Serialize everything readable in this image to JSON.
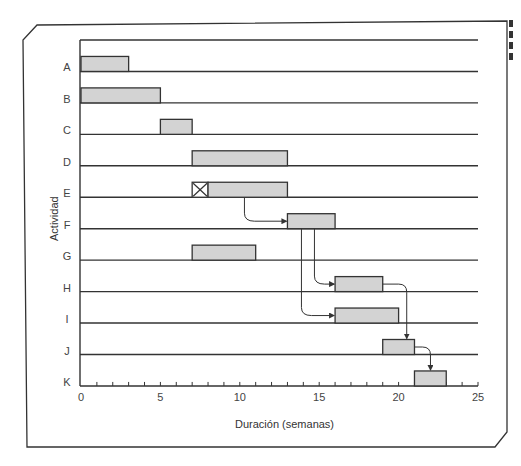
{
  "chart_data": {
    "type": "gantt",
    "title": "",
    "xlabel": "Duración (semanas)",
    "ylabel": "Actividad",
    "xlim": [
      0,
      25
    ],
    "xticks_major": [
      0,
      5,
      10,
      15,
      20,
      25
    ],
    "xticks_minor_step": 1,
    "grid": false,
    "bar_color": "#d3d3d3",
    "line_color": "#333333",
    "categories": [
      "A",
      "B",
      "C",
      "D",
      "E",
      "F",
      "G",
      "H",
      "I",
      "J",
      "K"
    ],
    "tasks": [
      {
        "name": "A",
        "start": 0,
        "end": 3
      },
      {
        "name": "B",
        "start": 0,
        "end": 5
      },
      {
        "name": "C",
        "start": 5,
        "end": 7
      },
      {
        "name": "D",
        "start": 7,
        "end": 13
      },
      {
        "name": "E",
        "start": 7,
        "end": 13,
        "crossed_segment": [
          7,
          8
        ]
      },
      {
        "name": "F",
        "start": 13,
        "end": 16
      },
      {
        "name": "G",
        "start": 7,
        "end": 11
      },
      {
        "name": "H",
        "start": 16,
        "end": 19
      },
      {
        "name": "I",
        "start": 16,
        "end": 20
      },
      {
        "name": "J",
        "start": 19,
        "end": 21
      },
      {
        "name": "K",
        "start": 21,
        "end": 23
      }
    ],
    "dependencies": [
      {
        "from": "E",
        "to": "F"
      },
      {
        "from": "F",
        "to": "H"
      },
      {
        "from": "F",
        "to": "I"
      },
      {
        "from": "H",
        "to": "J"
      },
      {
        "from": "J",
        "to": "K"
      }
    ]
  }
}
